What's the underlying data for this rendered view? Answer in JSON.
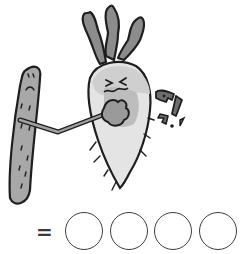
{
  "illustration": {
    "description": "Cartoon radish punching a cucumber-like vegetable with a sound effect",
    "sound_effect": "퍽!",
    "colors": {
      "outline": "#1e1e1e",
      "leaf_fill": "#8c8c8c",
      "cucumber_fill": "#a8a8a8",
      "radish_top": "#d8d8d8",
      "radish_body": "#e4e4e4",
      "fist_fill": "#9a9a9a"
    }
  },
  "puzzle": {
    "equals_sign": "=",
    "answer_slots": 4,
    "slot_values": [
      "",
      "",
      "",
      ""
    ]
  }
}
